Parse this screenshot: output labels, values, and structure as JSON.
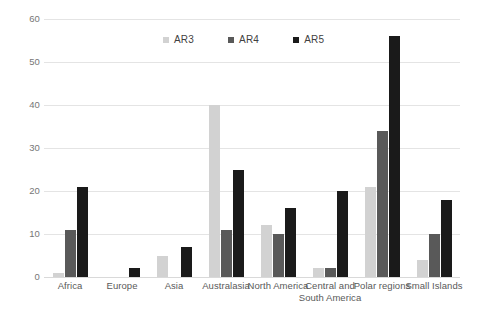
{
  "chart_data": {
    "type": "bar",
    "title": "",
    "subtitle": "",
    "xlabel": "",
    "ylabel": "",
    "ylim": [
      0,
      60
    ],
    "yticks": [
      0,
      10,
      20,
      30,
      40,
      50,
      60
    ],
    "grid": true,
    "legend_position": "top-center",
    "categories": [
      "Africa",
      "Europe",
      "Asia",
      "Australasia",
      "North America",
      "Central and\nSouth America",
      "Polar regions",
      "Small Islands"
    ],
    "series": [
      {
        "name": "AR3",
        "color": "#d2d2d2",
        "values": [
          1,
          0,
          5,
          40,
          12,
          2,
          21,
          4
        ]
      },
      {
        "name": "AR4",
        "color": "#595959",
        "values": [
          11,
          0,
          0,
          11,
          10,
          2,
          34,
          10
        ]
      },
      {
        "name": "AR5",
        "color": "#1a1a1a",
        "values": [
          21,
          2,
          7,
          25,
          16,
          20,
          56,
          18
        ]
      }
    ]
  },
  "legend": {
    "items": [
      {
        "label": "AR3",
        "color": "#d2d2d2"
      },
      {
        "label": "AR4",
        "color": "#595959"
      },
      {
        "label": "AR5",
        "color": "#1a1a1a"
      }
    ]
  },
  "axis": {
    "y_tick_labels": [
      "60",
      "50",
      "40",
      "30",
      "20",
      "10",
      "0"
    ]
  }
}
